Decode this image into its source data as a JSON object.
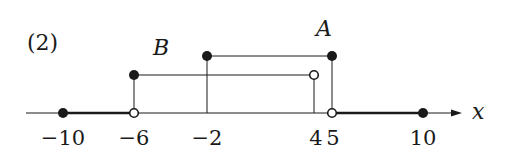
{
  "problem_label": "(2)",
  "axis": {
    "variable": "x",
    "ticks": [
      {
        "value": -10,
        "label": "−10"
      },
      {
        "value": -6,
        "label": "−6"
      },
      {
        "value": -2,
        "label": "−2"
      },
      {
        "value": 4,
        "label": "4"
      },
      {
        "value": 5,
        "label": "5"
      },
      {
        "value": 10,
        "label": "10"
      }
    ]
  },
  "sets": {
    "A": {
      "label": "A",
      "interval": "-2 <= x <= 5",
      "left": -2,
      "left_closed": true,
      "right": 5,
      "right_closed": true
    },
    "B": {
      "label": "B",
      "interval": "-6 <= x < 4",
      "left": -6,
      "left_closed": true,
      "right": 4,
      "right_closed": false
    }
  },
  "shaded_on_axis": [
    {
      "from": -10,
      "from_closed": true,
      "to": -6,
      "to_closed": false
    },
    {
      "from": 5,
      "from_closed": false,
      "to": 10,
      "to_closed": true
    }
  ],
  "colors": {
    "ink": "#1a1a1a",
    "background": "#ffffff"
  }
}
